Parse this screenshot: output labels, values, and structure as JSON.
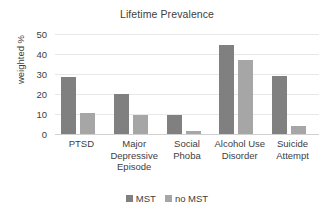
{
  "chart_data": {
    "type": "bar",
    "title": "Lifetime Prevalence",
    "xlabel": "",
    "ylabel": "weighted %",
    "ylim": [
      0,
      50
    ],
    "ytick_step": 10,
    "yticks": [
      "50",
      "40",
      "30",
      "20",
      "10",
      "0"
    ],
    "grid": true,
    "legend_position": "bottom",
    "categories": [
      "PTSD",
      "Major Depressive Episode",
      "Social Phoba",
      "Alcohol Use Disorder",
      "Suicide Attempt"
    ],
    "category_label_lines": [
      [
        "PTSD"
      ],
      [
        "Major",
        "Depressive",
        "Episode"
      ],
      [
        "Social",
        "Phoba"
      ],
      [
        "Alcohol Use",
        "Disorder"
      ],
      [
        "Suicide",
        "Attempt"
      ]
    ],
    "series": [
      {
        "name": "MST",
        "color": "#808080",
        "values": [
          28.5,
          20.2,
          9.6,
          44.5,
          29.2
        ]
      },
      {
        "name": "no MST",
        "color": "#a6a6a6",
        "values": [
          10.6,
          9.5,
          1.6,
          37.0,
          4.2
        ]
      }
    ]
  },
  "colors": {
    "mst": "#808080",
    "no_mst": "#a6a6a6",
    "gridline": "#e8e8e8",
    "text": "#404040",
    "background": "#ffffff"
  },
  "legend": {
    "items": [
      {
        "label": "MST",
        "color": "#808080"
      },
      {
        "label": "no MST",
        "color": "#a6a6a6"
      }
    ]
  }
}
